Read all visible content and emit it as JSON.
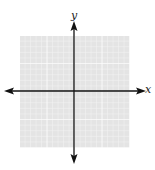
{
  "diagram": {
    "type": "coordinate-plane",
    "axes": {
      "x_label": "x",
      "y_label": "y",
      "arrowheads": [
        "left",
        "right",
        "up",
        "down"
      ]
    },
    "grid": {
      "cells_x": 20,
      "cells_y": 20,
      "background_color": "#e6e6e6",
      "line_color": "#ffffff",
      "axis_color": "#111111"
    }
  }
}
